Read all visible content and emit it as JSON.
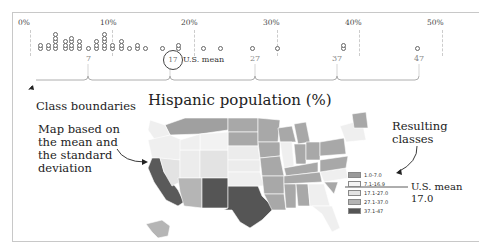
{
  "chart_data": {
    "type": "scatter",
    "title": "Hispanic population (%)",
    "subtype": "dot-plot with choropleth map",
    "x_axis": {
      "ticks": [
        "0%",
        "10%",
        "20%",
        "30%",
        "40%",
        "50%"
      ],
      "range": [
        0,
        50
      ]
    },
    "class_boundaries": [
      7,
      17,
      27,
      37,
      47
    ],
    "us_mean": 17.0,
    "us_mean_label": "U.S. mean",
    "legend": [
      {
        "label": "1.0-7.0",
        "color": "#9a9a9a"
      },
      {
        "label": "7.1-16.9",
        "color": "#f4f4f4"
      },
      {
        "label": "17.1-27.0",
        "color": "#e2e2e2"
      },
      {
        "label": "27.1-37.0",
        "color": "#b4b4b4"
      },
      {
        "label": "37.1-47",
        "color": "#555555"
      }
    ],
    "state_values_approx": [
      1.2,
      1.2,
      2.2,
      2.2,
      3.0,
      3.0,
      3.0,
      3.0,
      3.0,
      4.2,
      4.2,
      4.2,
      5.0,
      5.0,
      5.0,
      5.0,
      6.0,
      6.0,
      6.0,
      7.0,
      8.0,
      8.0,
      8.0,
      9.0,
      9.0,
      9.0,
      9.0,
      9.0,
      10.0,
      10.0,
      11.0,
      11.0,
      11.0,
      12.0,
      13.0,
      13.0,
      14.0,
      16.0,
      18.0,
      18.0,
      21.0,
      23.0,
      27.0,
      30.0,
      38.0,
      38.0,
      47.0
    ]
  },
  "axis": {
    "ticks": [
      {
        "label": "0%",
        "x": 24
      },
      {
        "label": "10%",
        "x": 105
      },
      {
        "label": "20%",
        "x": 186
      },
      {
        "label": "30%",
        "x": 268
      },
      {
        "label": "40%",
        "x": 350
      },
      {
        "label": "50%",
        "x": 432
      }
    ]
  },
  "boundaries": [
    {
      "label": "7",
      "x": 88
    },
    {
      "label": "27",
      "x": 255
    },
    {
      "label": "37",
      "x": 337
    },
    {
      "label": "47",
      "x": 419
    }
  ],
  "mean": {
    "value_label": "17",
    "text": "U.S. mean"
  },
  "annotations": {
    "class_boundaries": "Class boundaries",
    "map_note_1": "Map based on",
    "map_note_2": "the mean and",
    "map_note_3": "the standard",
    "map_note_4": "deviation",
    "resulting_1": "Resulting",
    "resulting_2": "classes",
    "mean_right_1": "U.S. mean",
    "mean_right_2": "17.0"
  },
  "map": {
    "title": "Hispanic population (%)"
  },
  "legend": [
    {
      "label": "1.0-7.0",
      "color": "#9a9a9a"
    },
    {
      "label": "7.1-16.9",
      "color": "#f4f4f4"
    },
    {
      "label": "17.1-27.0",
      "color": "#e2e2e2"
    },
    {
      "label": "27.1-37.0",
      "color": "#b4b4b4"
    },
    {
      "label": "37.1-47",
      "color": "#555555"
    }
  ]
}
